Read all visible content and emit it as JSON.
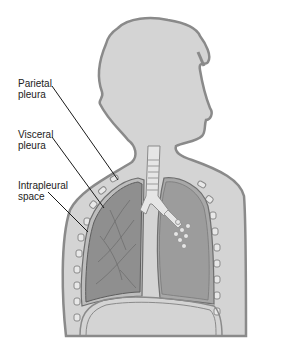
{
  "diagram": {
    "labels": [
      {
        "id": "parietal-pleura",
        "text": "Parietal\npleura"
      },
      {
        "id": "visceral-pleura",
        "text": "Visceral\npleura"
      },
      {
        "id": "intrapleural-space",
        "text": "Intrapleural\nspace"
      }
    ],
    "colors": {
      "body_fill": "#d4d4d4",
      "body_outline": "#8a8a8a",
      "lung_fill": "#9a9a9a",
      "lung_dark": "#7e7e7e",
      "pleura_outline": "#6f6f6f",
      "trachea_fill": "#e6e6e6",
      "leader_line": "#1a1a1a",
      "label_text": "#222222"
    }
  }
}
